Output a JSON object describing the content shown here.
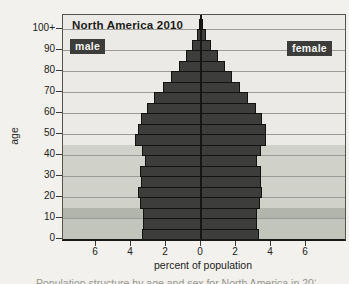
{
  "figure": {
    "title": "North America 2010",
    "male_label": "male",
    "female_label": "female",
    "y_axis_label": "age",
    "x_axis_label": "percent of population",
    "caption_fragment": "Population structure by age and sex for North America in 2010"
  },
  "colors": {
    "page_background": "#f2f1ee",
    "bar_fill": "#3d3d3c",
    "bar_outline": "#121211",
    "badge_background": "#3c3c3a",
    "badge_text": "#f4f4f2",
    "gridline": "#9c9c96",
    "center_axis": "#161614"
  },
  "chart_data": {
    "type": "bar",
    "subtype": "population-pyramid",
    "title": "North America 2010",
    "xlabel": "percent of population",
    "ylabel": "age",
    "x_tick_labels": [
      "6",
      "4",
      "2",
      "0",
      "2",
      "4",
      "6"
    ],
    "x_tick_values": [
      -6,
      -4,
      -2,
      0,
      2,
      4,
      6
    ],
    "xlim_per_side": 8,
    "y_tick_labels": [
      "0",
      "10",
      "20",
      "30",
      "40",
      "50",
      "60",
      "70",
      "80",
      "90",
      "100+"
    ],
    "y_tick_ages": [
      0,
      10,
      20,
      30,
      40,
      50,
      60,
      70,
      80,
      90,
      100
    ],
    "grid": "horizontal",
    "age_groups": [
      "0-4",
      "5-9",
      "10-14",
      "15-19",
      "20-24",
      "25-29",
      "30-34",
      "35-39",
      "40-44",
      "45-49",
      "50-54",
      "55-59",
      "60-64",
      "65-69",
      "70-74",
      "75-79",
      "80-84",
      "85-89",
      "90-94",
      "95-99",
      "100+"
    ],
    "series": [
      {
        "name": "male",
        "side": "left",
        "values": [
          3.4,
          3.3,
          3.3,
          3.5,
          3.6,
          3.45,
          3.5,
          3.2,
          3.4,
          3.8,
          3.6,
          3.45,
          3.1,
          2.7,
          2.15,
          1.7,
          1.25,
          0.85,
          0.5,
          0.25,
          0.08
        ]
      },
      {
        "name": "female",
        "side": "right",
        "values": [
          3.3,
          3.2,
          3.2,
          3.35,
          3.5,
          3.4,
          3.45,
          3.2,
          3.4,
          3.7,
          3.7,
          3.5,
          3.15,
          2.7,
          2.2,
          1.75,
          1.35,
          0.95,
          0.55,
          0.28,
          0.1
        ]
      }
    ],
    "background_bands": [
      {
        "name": "ages-45-plus",
        "age_from": 45,
        "age_to": 100,
        "color": "#ebeae6"
      },
      {
        "name": "ages-15-44",
        "age_from": 15,
        "age_to": 45,
        "color": "#d0d2ca"
      },
      {
        "name": "ages-10-14",
        "age_from": 10,
        "age_to": 15,
        "color": "#b2b5ab"
      },
      {
        "name": "ages-0-9",
        "age_from": 0,
        "age_to": 10,
        "color": "#c2c5bb"
      }
    ]
  }
}
